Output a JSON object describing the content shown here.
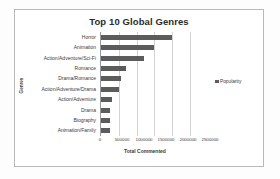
{
  "chart_data": {
    "type": "bar",
    "orientation": "horizontal",
    "title": "Top 10 Global Genres",
    "xlabel": "Total Commented",
    "ylabel": "Genres",
    "categories": [
      "Horror",
      "Animation",
      "Action/Adventure/Sci-Fi",
      "Romance",
      "Drama/Romance",
      "Action/Adventure/Drama",
      "Action/Adventure",
      "Drama",
      "Biography",
      "Animation/Family"
    ],
    "series": [
      {
        "name": "Popularity",
        "values": [
          1990000,
          1500000,
          1210000,
          690000,
          560000,
          510000,
          300000,
          250000,
          250000,
          260000
        ]
      }
    ],
    "xlim": [
      0,
      2500000
    ],
    "xticks": [
      0,
      500000,
      1000000,
      1500000,
      2000000,
      2500000
    ],
    "xtick_labels": [
      "0",
      "500000",
      "1000000",
      "1500000",
      "2000000",
      "2500000"
    ],
    "grid": "vertical",
    "legend_position": "right",
    "legend_entries": [
      "Popularity"
    ],
    "bar_color": "#5c5c5c",
    "gridline_color": "#d2d2d2",
    "frame_color": "#b9b9b9",
    "background_color": "#ffffff"
  }
}
